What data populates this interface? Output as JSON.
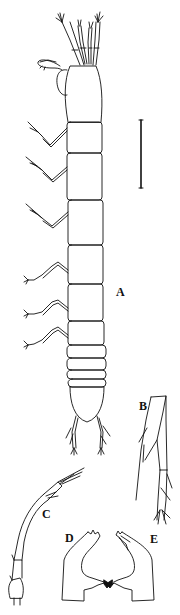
{
  "figure": {
    "panels": [
      {
        "id": "A",
        "label": "A",
        "description": "habitus, dorsal view"
      },
      {
        "id": "B",
        "label": "B",
        "description": "uropod / appendage detail"
      },
      {
        "id": "C",
        "label": "C",
        "description": "antennule"
      },
      {
        "id": "D",
        "label": "D",
        "description": "left mandible"
      },
      {
        "id": "E",
        "label": "E",
        "description": "right mandible"
      }
    ],
    "scale_bar": {
      "orientation": "vertical",
      "label": ""
    },
    "colors": {
      "line": "#111111",
      "background": "#ffffff"
    }
  }
}
